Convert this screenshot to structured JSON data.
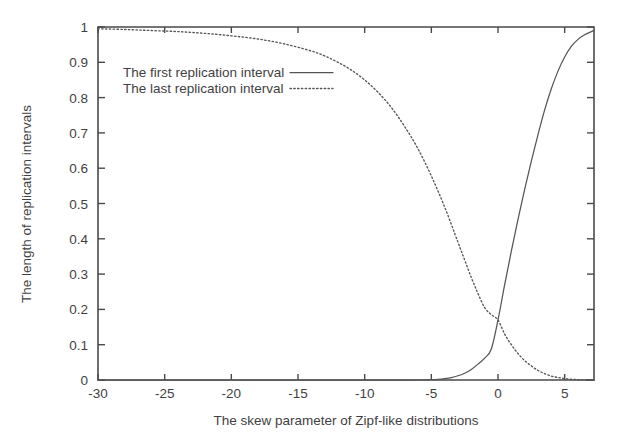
{
  "chart_data": {
    "type": "line",
    "title": "",
    "xlabel": "The skew parameter of Zipf-like distributions",
    "ylabel": "The length of replication intervals",
    "xlim": [
      -30,
      7.2
    ],
    "ylim": [
      0,
      1
    ],
    "grid": false,
    "legend_position": "upper-left-inside",
    "xticks": [
      -30,
      -25,
      -20,
      -15,
      -10,
      -5,
      0,
      5
    ],
    "xticklabels": [
      "-30",
      "-25",
      "-20",
      "-15",
      "-10",
      "-5",
      "0",
      "5"
    ],
    "yticks": [
      0,
      0.1,
      0.2,
      0.3,
      0.4,
      0.5,
      0.6,
      0.7,
      0.8,
      0.9,
      1
    ],
    "yticklabels": [
      "0",
      "0.1",
      "0.2",
      "0.3",
      "0.4",
      "0.5",
      "0.6",
      "0.7",
      "0.8",
      "0.9",
      "1"
    ],
    "series": [
      {
        "name": "The first replication interval",
        "style": "solid",
        "color": "#555555",
        "x": [
          -30,
          -28,
          -26,
          -24,
          -22,
          -20,
          -18,
          -16,
          -14,
          -12,
          -10,
          -9,
          -8,
          -7,
          -6,
          -5,
          -4.5,
          -4,
          -3.5,
          -3,
          -2.5,
          -2,
          -1.5,
          -1,
          -0.5,
          0,
          0.5,
          1,
          1.5,
          2,
          2.5,
          3,
          3.5,
          4,
          4.5,
          5,
          5.5,
          6,
          6.5,
          7,
          7.2
        ],
        "y": [
          0.0,
          0.0,
          0.0,
          0.0,
          0.0,
          0.0,
          0.0,
          0.0,
          0.0,
          0.0,
          0.0,
          0.0,
          0.0,
          0.0,
          0.0,
          0.001,
          0.002,
          0.004,
          0.007,
          0.012,
          0.019,
          0.03,
          0.045,
          0.062,
          0.088,
          0.17,
          0.27,
          0.365,
          0.455,
          0.54,
          0.62,
          0.695,
          0.765,
          0.825,
          0.875,
          0.915,
          0.945,
          0.965,
          0.978,
          0.987,
          0.99
        ]
      },
      {
        "name": "The last replication interval",
        "style": "dotted",
        "color": "#555555",
        "x": [
          -30,
          -28,
          -26,
          -24,
          -22,
          -20,
          -18,
          -16,
          -14,
          -13,
          -12,
          -11,
          -10,
          -9,
          -8,
          -7,
          -6,
          -5,
          -4,
          -3,
          -2.5,
          -2,
          -1.5,
          -1,
          -0.5,
          0,
          0.5,
          1,
          1.5,
          2,
          2.5,
          3,
          3.5,
          4,
          4.5,
          5,
          5.5,
          6,
          6.5,
          7,
          7.2
        ],
        "y": [
          0.995,
          0.993,
          0.99,
          0.987,
          0.982,
          0.975,
          0.966,
          0.952,
          0.932,
          0.918,
          0.9,
          0.878,
          0.85,
          0.815,
          0.772,
          0.718,
          0.655,
          0.578,
          0.49,
          0.39,
          0.34,
          0.29,
          0.245,
          0.205,
          0.185,
          0.17,
          0.13,
          0.1,
          0.075,
          0.055,
          0.04,
          0.027,
          0.018,
          0.011,
          0.007,
          0.004,
          0.002,
          0.001,
          0.0,
          0.0,
          0.0
        ]
      }
    ],
    "annotations": []
  },
  "legend": {
    "entries": [
      {
        "label": "The first replication interval",
        "style": "solid"
      },
      {
        "label": "The last replication interval",
        "style": "dotted"
      }
    ]
  }
}
